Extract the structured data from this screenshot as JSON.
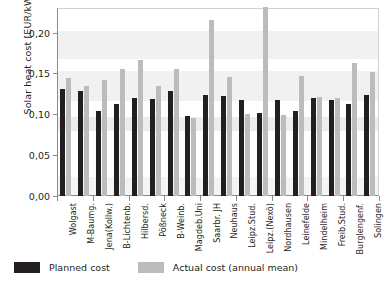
{
  "chart_data": {
    "type": "bar",
    "title": "",
    "xlabel": "",
    "ylabel": "Solar heat cost [EUR/kWh]",
    "ylim": [
      0.0,
      0.23
    ],
    "yticks": [
      "0,00",
      "0,05",
      "0,10",
      "0,15",
      "0,20"
    ],
    "ytick_values": [
      0.0,
      0.05,
      0.1,
      0.15,
      0.2
    ],
    "grid": false,
    "legend_position": "below-axes",
    "decimal_separator": ",",
    "categories": [
      "Wolgast",
      "M-Baumg.",
      "Jena(Kollw.)",
      "B-Lichtenb.",
      "Hilbersd.",
      "Pößneck",
      "B-Weinb.",
      "Magdeb.Uni",
      "Saarbr. JH",
      "Neuhaus",
      "Leipz.Stud.",
      "Leipz.(Nexö)",
      "Nordhausen",
      "Leinefelde",
      "Mindelheim",
      "Freib.Stud.",
      "Burglengenf.",
      "Solingen"
    ],
    "series": [
      {
        "name": "Planned cost",
        "color": "#231f20",
        "values": [
          0.131,
          0.128,
          0.104,
          0.112,
          0.12,
          0.119,
          0.128,
          0.098,
          0.123,
          0.122,
          0.118,
          0.101,
          0.118,
          0.104,
          0.12,
          0.117,
          0.112,
          0.123
        ]
      },
      {
        "name": "Actual cost (annual mean)",
        "color": "#bcbcbc",
        "values": [
          0.144,
          0.134,
          0.142,
          0.156,
          0.167,
          0.135,
          0.156,
          0.096,
          0.215,
          0.145,
          0.1,
          0.231,
          0.099,
          0.147,
          0.121,
          0.12,
          0.163,
          0.152
        ]
      }
    ]
  },
  "legend": {
    "planned_label": "Planned cost",
    "actual_label": "Actual cost (annual mean)"
  }
}
